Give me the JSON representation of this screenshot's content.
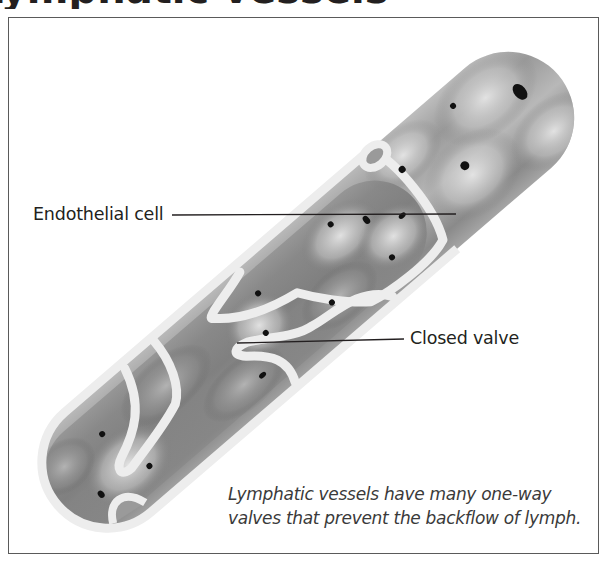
{
  "heading": {
    "text": "Lymphatic vessels"
  },
  "figure": {
    "labels": {
      "endothelial_cell": "Endothelial cell",
      "closed_valve": "Closed valve"
    },
    "caption": {
      "line1": "Lymphatic vessels have many one-way",
      "line2": "valves that prevent the backflow of lymph."
    },
    "colors": {
      "frame": "#5a5a5a",
      "vessel_light": "#d9d9d9",
      "vessel_dark": "#6e6e6e",
      "valve_outline": "#eeeeee",
      "nucleus": "#111111",
      "leader_line": "#231f20"
    }
  }
}
